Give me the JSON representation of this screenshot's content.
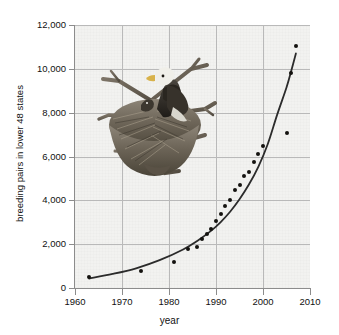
{
  "chart_data": {
    "type": "scatter",
    "title": "",
    "xlabel": "year",
    "ylabel": "breeding pairs in lower 48 states",
    "xlim": [
      1960,
      2010
    ],
    "ylim": [
      0,
      12000
    ],
    "grid": true,
    "legend": null,
    "x_ticks": [
      "1960",
      "1970",
      "1980",
      "1990",
      "2000",
      "2010"
    ],
    "y_ticks": [
      "0",
      "2,000",
      "4,000",
      "6,000",
      "8,000",
      "10,000",
      "12,000"
    ],
    "series": [
      {
        "name": "bald eagle breeding pairs",
        "marker": "filled-circle",
        "color": "#14120f",
        "points": [
          {
            "x": 1963,
            "y": 487
          },
          {
            "x": 1974,
            "y": 791
          },
          {
            "x": 1981,
            "y": 1188
          },
          {
            "x": 1984,
            "y": 1757
          },
          {
            "x": 1986,
            "y": 1875
          },
          {
            "x": 1987,
            "y": 2238
          },
          {
            "x": 1988,
            "y": 2475
          },
          {
            "x": 1989,
            "y": 2680
          },
          {
            "x": 1990,
            "y": 3035
          },
          {
            "x": 1991,
            "y": 3399
          },
          {
            "x": 1992,
            "y": 3749
          },
          {
            "x": 1993,
            "y": 4015
          },
          {
            "x": 1994,
            "y": 4449
          },
          {
            "x": 1995,
            "y": 4712
          },
          {
            "x": 1996,
            "y": 5094
          },
          {
            "x": 1997,
            "y": 5295
          },
          {
            "x": 1998,
            "y": 5748
          },
          {
            "x": 1999,
            "y": 6104
          },
          {
            "x": 2000,
            "y": 6471
          },
          {
            "x": 2005,
            "y": 7066
          },
          {
            "x": 2006,
            "y": 9789
          },
          {
            "x": 2007,
            "y": 11040
          }
        ]
      },
      {
        "name": "exponential fit curve",
        "marker": "line",
        "color": "#2b2b2b",
        "fit_points": [
          {
            "x": 1963,
            "y": 430
          },
          {
            "x": 1968,
            "y": 640
          },
          {
            "x": 1973,
            "y": 900
          },
          {
            "x": 1978,
            "y": 1270
          },
          {
            "x": 1983,
            "y": 1760
          },
          {
            "x": 1986,
            "y": 2150
          },
          {
            "x": 1989,
            "y": 2620
          },
          {
            "x": 1991,
            "y": 3010
          },
          {
            "x": 1993,
            "y": 3480
          },
          {
            "x": 1995,
            "y": 4050
          },
          {
            "x": 1997,
            "y": 4720
          },
          {
            "x": 1999,
            "y": 5530
          },
          {
            "x": 2001,
            "y": 6560
          },
          {
            "x": 2003,
            "y": 7900
          },
          {
            "x": 2005,
            "y": 9150
          },
          {
            "x": 2006,
            "y": 9900
          },
          {
            "x": 2007,
            "y": 10700
          }
        ]
      }
    ]
  },
  "photo": {
    "alt_name": "bald-eagle-on-nest-photograph",
    "caption": ""
  },
  "colors": {
    "plot_background": "#f2f2f0",
    "gridline": "#b9b9b9",
    "axis": "#8c8c8c",
    "marker": "#14120f",
    "curve": "#2b2b2b",
    "text": "#111111"
  }
}
